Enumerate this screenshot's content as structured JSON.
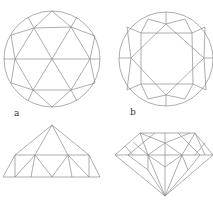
{
  "figure": {
    "labels": {
      "a": "a",
      "b": "b"
    },
    "stroke_color": "#8a8a8a",
    "background": "#ffffff",
    "panels": [
      {
        "id": "rose-cut-top",
        "description": "Rose cut, top view: circle with triangular facets"
      },
      {
        "id": "brilliant-cut-top",
        "description": "Brilliant cut, top view: circle with octagonal star table"
      },
      {
        "id": "rose-cut-side",
        "description": "Rose cut, side profile: dome of triangular facets on flat base"
      },
      {
        "id": "brilliant-cut-side",
        "description": "Brilliant cut, side profile: crown, girdle and pavilion to culet"
      }
    ]
  }
}
